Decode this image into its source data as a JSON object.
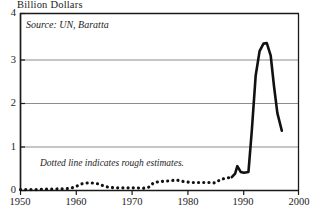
{
  "chart_data": {
    "type": "line",
    "title": "Billion Dollars",
    "xlabel": "",
    "ylabel": "Billion Dollars",
    "xlim": [
      1950,
      2000
    ],
    "ylim": [
      0,
      4
    ],
    "xticks": [
      1950,
      1960,
      1970,
      1980,
      1990,
      2000
    ],
    "yticks": [
      0,
      1,
      2,
      3,
      4
    ],
    "grid": "horizontal",
    "legend": "none",
    "annotations": [
      {
        "name": "source",
        "text": "Source: UN, Baratta"
      },
      {
        "name": "estimates",
        "text": "Dotted line indicates rough estimates."
      }
    ],
    "series": [
      {
        "name": "rough-estimates",
        "style": "dotted",
        "x": [
          1950,
          1951,
          1952,
          1953,
          1954,
          1955,
          1956,
          1957,
          1958,
          1959,
          1960,
          1961,
          1962,
          1963,
          1964,
          1965,
          1966,
          1967,
          1968,
          1969,
          1970,
          1971,
          1972,
          1973,
          1974,
          1975,
          1976,
          1977,
          1978,
          1979,
          1980,
          1981,
          1982,
          1983,
          1984,
          1985,
          1986,
          1987,
          1988
        ],
        "values": [
          0.02,
          0.02,
          0.02,
          0.02,
          0.03,
          0.03,
          0.03,
          0.04,
          0.04,
          0.05,
          0.09,
          0.15,
          0.17,
          0.17,
          0.15,
          0.1,
          0.07,
          0.06,
          0.06,
          0.06,
          0.06,
          0.06,
          0.05,
          0.07,
          0.18,
          0.2,
          0.21,
          0.22,
          0.24,
          0.21,
          0.19,
          0.18,
          0.18,
          0.18,
          0.18,
          0.17,
          0.25,
          0.28,
          0.3
        ]
      },
      {
        "name": "actual",
        "style": "solid",
        "x": [
          1988,
          1988.6,
          1989,
          1989.6,
          1990.2,
          1991,
          1991.6,
          1992.3,
          1993,
          1993.7,
          1994.3,
          1995,
          1995.6,
          1996.2,
          1997
        ],
        "values": [
          0.3,
          0.38,
          0.55,
          0.42,
          0.4,
          0.42,
          1.35,
          2.6,
          3.15,
          3.32,
          3.33,
          3.05,
          2.35,
          1.75,
          1.35
        ]
      }
    ]
  }
}
